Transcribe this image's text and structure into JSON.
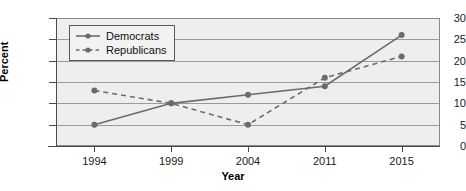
{
  "chart_data": {
    "type": "line",
    "title": "",
    "xlabel": "Year",
    "ylabel": "Percent",
    "categories": [
      "1994",
      "1999",
      "2004",
      "2011",
      "2015"
    ],
    "ylim": [
      0,
      30
    ],
    "yticks": [
      "0",
      "5",
      "10",
      "15",
      "20",
      "25",
      "30"
    ],
    "grid": true,
    "legend_position": "top-left",
    "series": [
      {
        "name": "Democrats",
        "values": [
          5,
          10,
          12,
          14,
          26
        ],
        "style": "solid",
        "color": "#6b6b6b",
        "marker": "circle"
      },
      {
        "name": "Republicans",
        "values": [
          13,
          10,
          5,
          16,
          21
        ],
        "style": "dashed",
        "color": "#6b6b6b",
        "marker": "circle"
      }
    ]
  },
  "colors": {
    "plot_background": "#eeeeee",
    "gridline": "#9a9a9a",
    "axis": "#4a4a4a",
    "series": "#6b6b6b",
    "text": "#1a1a1a"
  }
}
